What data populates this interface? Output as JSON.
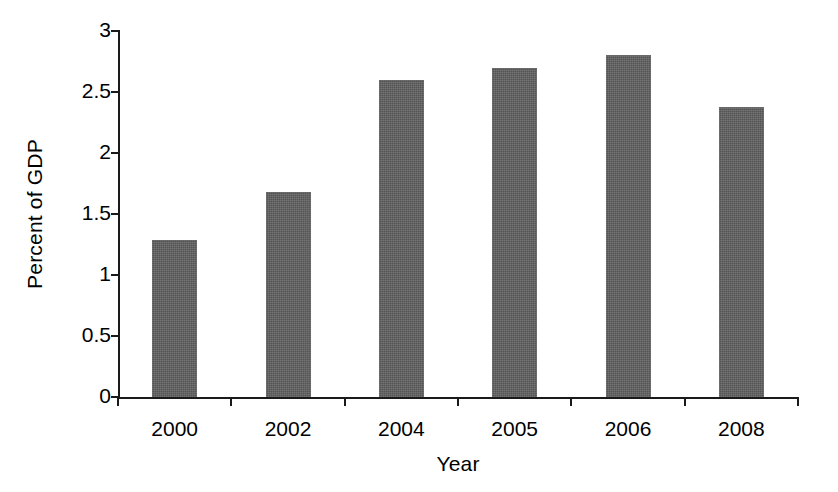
{
  "chart_data": {
    "type": "bar",
    "title": "",
    "subtitle": "",
    "xlabel": "Year",
    "ylabel": "Percent of GDP",
    "categories": [
      "2000",
      "2002",
      "2004",
      "2005",
      "2006",
      "2008"
    ],
    "values": [
      1.29,
      1.68,
      2.6,
      2.7,
      2.8,
      2.38
    ],
    "series": [
      {
        "name": "Percent of GDP",
        "values": [
          1.29,
          1.68,
          2.6,
          2.7,
          2.8,
          2.38
        ]
      }
    ],
    "ylim": [
      0,
      3
    ],
    "ytick_values": [
      0,
      0.5,
      1,
      1.5,
      2,
      2.5,
      3
    ],
    "ytick_labels": [
      "0",
      "0.5",
      "1",
      "1.5",
      "2",
      "2.5",
      "3"
    ],
    "xtick_labels": [
      "2000",
      "2002",
      "2004",
      "2005",
      "2006",
      "2008"
    ],
    "grid": false,
    "legend": false,
    "legend_position": "none",
    "annotations": [],
    "colors": {
      "bar": "#545454",
      "axis": "#1a1a1a",
      "background": "#ffffff",
      "text": "#000000"
    }
  }
}
